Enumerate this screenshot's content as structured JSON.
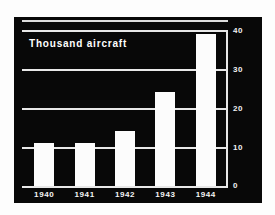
{
  "chart_data": {
    "type": "bar",
    "title": "Thousand aircraft",
    "subtitle": "",
    "xlabel": "",
    "ylabel": "",
    "categories": [
      "1940",
      "1941",
      "1942",
      "1943",
      "1944"
    ],
    "values": [
      11,
      11,
      14,
      24,
      39
    ],
    "series": [
      {
        "name": "Thousand aircraft",
        "values": [
          11,
          11,
          14,
          24,
          39
        ]
      }
    ],
    "ylim": [
      0,
      40
    ],
    "yticks": [
      0,
      10,
      20,
      30,
      40
    ],
    "ytick_labels": [
      "0",
      "10",
      "20",
      "30",
      "40"
    ],
    "grid": true,
    "grid_orientation": "horizontal",
    "legend": false,
    "legend_position": "none",
    "axis_side": "right",
    "background_color": "#080808",
    "bar_color": "#fcfcfc",
    "grid_color": "#e8e8e8",
    "text_color": "#ffffff"
  },
  "labels": {
    "y0": "0",
    "y10": "10",
    "y20": "20",
    "y30": "30",
    "y40": "40",
    "x1": "1940",
    "x2": "1941",
    "x3": "1942",
    "x4": "1943",
    "x5": "1944"
  }
}
